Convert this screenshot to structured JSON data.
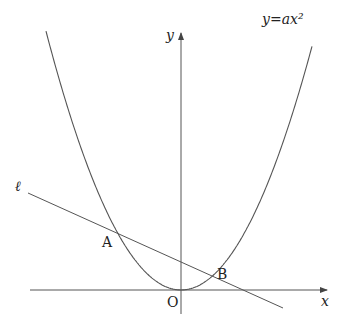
{
  "diagram": {
    "type": "coordinate-geometry",
    "labels": {
      "curve": "y=ax²",
      "line": "ℓ",
      "point_a": "A",
      "point_b": "B",
      "origin": "O",
      "x_axis": "x",
      "y_axis": "y"
    },
    "colors": {
      "stroke": "#555555",
      "text": "#222222",
      "background": "#ffffff"
    },
    "geometry": {
      "origin_px": [
        181,
        290
      ],
      "parabola_k": 0.0142,
      "line_start_px": [
        28,
        193
      ],
      "line_end_px": [
        283,
        308
      ],
      "point_a_px": [
        117,
        233
      ],
      "point_b_px": [
        212,
        276
      ]
    }
  }
}
